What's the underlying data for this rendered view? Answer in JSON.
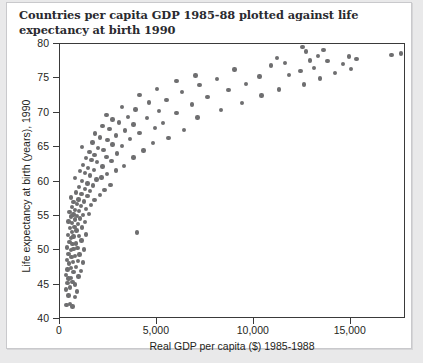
{
  "chart_data": {
    "type": "scatter",
    "title": "Countries per capita GDP 1985-88 plotted against life expectancy at birth 1990",
    "xlabel": "Real GDP per capita ($) 1985-1988",
    "ylabel": "Life expectancy at birth (years), 1990",
    "xlim": [
      0,
      17850
    ],
    "ylim": [
      40,
      80
    ],
    "xticks": [
      0,
      5000,
      10000,
      15000
    ],
    "xtick_labels": [
      "0",
      "5,000",
      "10,000",
      "15,000"
    ],
    "yticks": [
      40,
      45,
      50,
      55,
      60,
      65,
      70,
      75,
      80
    ],
    "ytick_labels": [
      "40",
      "45",
      "50",
      "55",
      "60",
      "65",
      "70",
      "75",
      "80"
    ],
    "grid": false,
    "legend": null,
    "marker_color": "#6e6e70",
    "marker_size_px": 4.4,
    "point_count": 168,
    "points": [
      [
        330,
        42.0
      ],
      [
        500,
        42.2
      ],
      [
        640,
        41.8
      ],
      [
        430,
        43.4
      ],
      [
        760,
        43.2
      ],
      [
        300,
        44.3
      ],
      [
        520,
        44.6
      ],
      [
        870,
        44.0
      ],
      [
        380,
        45.2
      ],
      [
        640,
        45.4
      ],
      [
        760,
        45.0
      ],
      [
        430,
        45.9
      ],
      [
        560,
        46.0
      ],
      [
        300,
        46.4
      ],
      [
        950,
        46.2
      ],
      [
        700,
        46.8
      ],
      [
        380,
        47.2
      ],
      [
        560,
        47.4
      ],
      [
        1090,
        47.0
      ],
      [
        820,
        47.6
      ],
      [
        470,
        48.1
      ],
      [
        660,
        48.3
      ],
      [
        350,
        48.6
      ],
      [
        930,
        48.4
      ],
      [
        1200,
        48.2
      ],
      [
        600,
        49.0
      ],
      [
        780,
        49.2
      ],
      [
        430,
        49.5
      ],
      [
        1010,
        49.4
      ],
      [
        560,
        50.0
      ],
      [
        700,
        50.2
      ],
      [
        350,
        50.4
      ],
      [
        900,
        50.3
      ],
      [
        1240,
        50.1
      ],
      [
        640,
        50.9
      ],
      [
        480,
        51.2
      ],
      [
        820,
        51.0
      ],
      [
        1100,
        51.4
      ],
      [
        560,
        51.8
      ],
      [
        700,
        52.0
      ],
      [
        400,
        52.2
      ],
      [
        980,
        52.1
      ],
      [
        1350,
        52.3
      ],
      [
        620,
        52.7
      ],
      [
        850,
        52.9
      ],
      [
        3960,
        52.6
      ],
      [
        500,
        53.2
      ],
      [
        740,
        53.4
      ],
      [
        1130,
        53.3
      ],
      [
        930,
        53.8
      ],
      [
        620,
        54.0
      ],
      [
        430,
        54.2
      ],
      [
        1290,
        54.1
      ],
      [
        780,
        54.5
      ],
      [
        1020,
        54.6
      ],
      [
        560,
        54.9
      ],
      [
        870,
        55.0
      ],
      [
        700,
        55.2
      ],
      [
        1180,
        55.1
      ],
      [
        1480,
        55.3
      ],
      [
        480,
        55.6
      ],
      [
        980,
        55.7
      ],
      [
        760,
        55.9
      ],
      [
        1330,
        56.0
      ],
      [
        620,
        56.3
      ],
      [
        1090,
        56.4
      ],
      [
        870,
        56.7
      ],
      [
        1600,
        56.6
      ],
      [
        700,
        57.0
      ],
      [
        1240,
        57.1
      ],
      [
        950,
        57.4
      ],
      [
        1780,
        57.3
      ],
      [
        560,
        57.7
      ],
      [
        1420,
        57.9
      ],
      [
        1100,
        58.2
      ],
      [
        2050,
        58.0
      ],
      [
        820,
        58.4
      ],
      [
        1560,
        58.6
      ],
      [
        1280,
        58.9
      ],
      [
        2300,
        58.8
      ],
      [
        980,
        59.2
      ],
      [
        1700,
        59.4
      ],
      [
        1420,
        59.7
      ],
      [
        2600,
        59.5
      ],
      [
        1150,
        60.1
      ],
      [
        1880,
        60.3
      ],
      [
        780,
        60.5
      ],
      [
        2150,
        60.6
      ],
      [
        1560,
        60.9
      ],
      [
        1300,
        61.2
      ],
      [
        2420,
        61.1
      ],
      [
        1020,
        61.5
      ],
      [
        1750,
        61.7
      ],
      [
        2900,
        61.6
      ],
      [
        1450,
        62.0
      ],
      [
        2200,
        62.2
      ],
      [
        1200,
        62.4
      ],
      [
        3300,
        62.3
      ],
      [
        1900,
        62.8
      ],
      [
        1620,
        63.1
      ],
      [
        2650,
        63.0
      ],
      [
        1350,
        63.4
      ],
      [
        2400,
        63.6
      ],
      [
        3800,
        63.5
      ],
      [
        1780,
        63.9
      ],
      [
        2950,
        64.1
      ],
      [
        1520,
        64.3
      ],
      [
        2250,
        64.6
      ],
      [
        4300,
        64.5
      ],
      [
        1950,
        64.9
      ],
      [
        1150,
        65.0
      ],
      [
        3200,
        65.2
      ],
      [
        2700,
        65.4
      ],
      [
        1680,
        65.7
      ],
      [
        4800,
        65.6
      ],
      [
        2450,
        66.0
      ],
      [
        3600,
        66.2
      ],
      [
        2050,
        66.4
      ],
      [
        5600,
        66.3
      ],
      [
        2900,
        66.7
      ],
      [
        1820,
        67.0
      ],
      [
        4100,
        67.1
      ],
      [
        3350,
        67.4
      ],
      [
        2550,
        67.6
      ],
      [
        6400,
        67.5
      ],
      [
        4900,
        67.8
      ],
      [
        2200,
        68.1
      ],
      [
        3800,
        68.3
      ],
      [
        3050,
        68.6
      ],
      [
        5300,
        68.5
      ],
      [
        2700,
        69.0
      ],
      [
        4500,
        69.2
      ],
      [
        3500,
        69.4
      ],
      [
        7100,
        69.3
      ],
      [
        2400,
        69.7
      ],
      [
        6000,
        70.0
      ],
      [
        5100,
        70.3
      ],
      [
        3900,
        70.5
      ],
      [
        8300,
        70.4
      ],
      [
        3200,
        70.8
      ],
      [
        6800,
        71.2
      ],
      [
        4600,
        71.5
      ],
      [
        9400,
        71.4
      ],
      [
        5500,
        71.9
      ],
      [
        7600,
        72.3
      ],
      [
        4100,
        72.6
      ],
      [
        10400,
        72.5
      ],
      [
        6300,
        73.0
      ],
      [
        8700,
        73.3
      ],
      [
        5000,
        73.5
      ],
      [
        11300,
        73.4
      ],
      [
        7200,
        74.0
      ],
      [
        9600,
        74.2
      ],
      [
        12600,
        74.1
      ],
      [
        6000,
        74.6
      ],
      [
        8100,
        74.9
      ],
      [
        13400,
        75.0
      ],
      [
        10300,
        75.3
      ],
      [
        11800,
        75.5
      ],
      [
        7000,
        75.4
      ],
      [
        14200,
        75.8
      ],
      [
        12400,
        76.1
      ],
      [
        9000,
        76.3
      ],
      [
        13100,
        76.5
      ],
      [
        15000,
        76.4
      ],
      [
        10900,
        76.9
      ],
      [
        11600,
        77.2
      ],
      [
        14600,
        77.1
      ],
      [
        12900,
        77.6
      ],
      [
        13800,
        77.5
      ],
      [
        15300,
        77.8
      ],
      [
        11200,
        78.0
      ],
      [
        13300,
        78.3
      ],
      [
        14900,
        78.2
      ],
      [
        17100,
        78.4
      ],
      [
        17600,
        78.6
      ],
      [
        12700,
        78.9
      ],
      [
        13600,
        79.1
      ],
      [
        12500,
        79.6
      ]
    ]
  }
}
